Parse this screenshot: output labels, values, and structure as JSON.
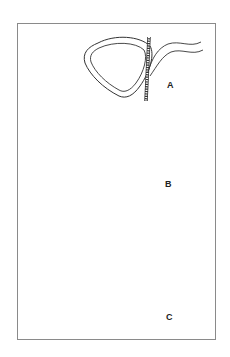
{
  "figure": {
    "panels": [
      {
        "id": "A",
        "label": "A",
        "description": "Rounded-triangle ring with a braided suture passing vertically along the right side; a curved instrument/tube approaches from upper right"
      },
      {
        "id": "B",
        "label": "B",
        "description": "Braided suture looped around the ring from lower-left to upper-right; a curved tube approaches from the left and meets the ring's bottom"
      },
      {
        "id": "C",
        "label": "C",
        "description": "Braided suture wrapped fully around the ring with two free ends pointing upward; a curved tube approaches from the upper right"
      }
    ]
  },
  "colors": {
    "line": "#333333",
    "frame": "#8a8a8a",
    "background": "#ffffff"
  }
}
